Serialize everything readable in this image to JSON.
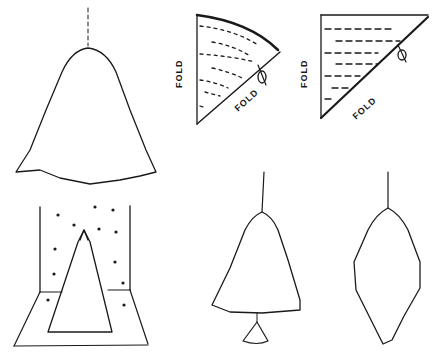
{
  "illustration": {
    "panels": [
      {
        "id": "hanging-cone-large",
        "description": "large scalloped paper cone ornament hanging on string"
      },
      {
        "id": "quarter-circle-fold",
        "labels": [
          "FOLD",
          "FOLD"
        ],
        "description": "folded quarter-circle with curved dashed cut lines and scissors"
      },
      {
        "id": "triangle-fold",
        "labels": [
          "FOLD",
          "FOLD"
        ],
        "description": "folded square-corner triangle with straight dashed cut lines and scissors"
      },
      {
        "id": "tree-in-box",
        "description": "cone tree standing in a corner box with snow dots"
      },
      {
        "id": "hanging-tree-with-bell",
        "description": "hanging cone tree with small bell below"
      },
      {
        "id": "hanging-diamond",
        "description": "hanging diamond-shaped scalloped ornament"
      }
    ],
    "fold_label": "FOLD",
    "ink_color": "#1a1a1a",
    "background": "#ffffff"
  }
}
